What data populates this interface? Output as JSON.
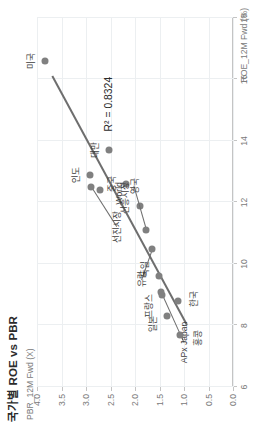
{
  "chart_data": {
    "type": "scatter",
    "title": "국가별 ROE vs PBR",
    "xlabel": "ROE_12M Fwd (%)",
    "ylabel": "PBR_12M Fwd (X)",
    "xlim": [
      6,
      18
    ],
    "ylim": [
      0.0,
      4.0
    ],
    "xticks": [
      6,
      8,
      10,
      12,
      14,
      16,
      18
    ],
    "xtick_labels": [
      "6",
      "8",
      "10",
      "12",
      "14",
      "16",
      "18"
    ],
    "yticks": [
      0.0,
      0.5,
      1.0,
      1.5,
      2.0,
      2.5,
      3.0,
      3.5,
      4.0
    ],
    "ytick_labels": [
      "0.0",
      "0.5",
      "1.0",
      "1.5",
      "2.0",
      "2.5",
      "3.0",
      "3.5",
      "4.0"
    ],
    "grid": true,
    "legend": false,
    "marker_color": "#808080",
    "trendline_color": "#6e6e6e",
    "annotation": "R² = 0.8324",
    "r_squared": 0.8324,
    "trendline": {
      "x0": 8.0,
      "y0": 0.95,
      "x1": 16.1,
      "y1": 3.7
    },
    "points": [
      {
        "label": "미국",
        "x": 16.6,
        "y": 3.84,
        "label_dx": 0,
        "label_dy": 0.3,
        "leader": false
      },
      {
        "label": "인도",
        "x": 12.9,
        "y": 2.92,
        "label_dx": 0,
        "label_dy": 0.3,
        "leader": false
      },
      {
        "label": "선진시장",
        "x": 12.5,
        "y": 2.9,
        "label_dx": -1.3,
        "label_dy": -0.52,
        "leader": true
      },
      {
        "label": "World",
        "x": 12.4,
        "y": 2.72,
        "label_dx": -0.1,
        "label_dy": -0.4,
        "leader": false
      },
      {
        "label": "대만",
        "x": 13.7,
        "y": 2.53,
        "label_dx": 0,
        "label_dy": 0.3,
        "leader": false
      },
      {
        "label": "중국",
        "x": 12.6,
        "y": 2.19,
        "label_dx": 0,
        "label_dy": 0.3,
        "leader": false
      },
      {
        "label": "신흥시장",
        "x": 11.9,
        "y": 1.9,
        "label_dx": 0.25,
        "label_dy": 0.33,
        "leader": false
      },
      {
        "label": "영국",
        "x": 11.1,
        "y": 1.77,
        "label_dx": 1.45,
        "label_dy": 0.26,
        "leader": true
      },
      {
        "label": "유럽",
        "x": 10.5,
        "y": 1.66,
        "label_dx": -1.0,
        "label_dy": 0.22,
        "leader": true
      },
      {
        "label": "독일",
        "x": 9.6,
        "y": 1.52,
        "label_dx": 0.25,
        "label_dy": 0.3,
        "leader": false
      },
      {
        "label": "프랑스",
        "x": 9.1,
        "y": 1.46,
        "label_dx": -0.45,
        "label_dy": 0.28,
        "leader": false
      },
      {
        "label": "APx Japan",
        "x": 9.0,
        "y": 1.44,
        "label_dx": -1.55,
        "label_dy": -0.44,
        "leader": true
      },
      {
        "label": "한국",
        "x": 8.8,
        "y": 1.12,
        "label_dx": 0.05,
        "label_dy": -0.3,
        "leader": false
      },
      {
        "label": "일본",
        "x": 8.3,
        "y": 1.35,
        "label_dx": -0.25,
        "label_dy": 0.3,
        "leader": false
      },
      {
        "label": "홍콩",
        "x": 7.7,
        "y": 1.08,
        "label_dx": -0.1,
        "label_dy": -0.34,
        "leader": false
      }
    ]
  }
}
